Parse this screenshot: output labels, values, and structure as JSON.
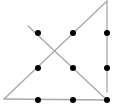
{
  "diagram": {
    "width": 116,
    "height": 105,
    "background": "#ffffff",
    "line_color": "#a8a8a8",
    "line_width": 1.3,
    "dot_color": "#000000",
    "dot_radius": 3,
    "dots": [
      {
        "x": 38,
        "y": 33
      },
      {
        "x": 73,
        "y": 33
      },
      {
        "x": 107,
        "y": 33
      },
      {
        "x": 38,
        "y": 68
      },
      {
        "x": 73,
        "y": 68
      },
      {
        "x": 107,
        "y": 68
      },
      {
        "x": 38,
        "y": 100
      },
      {
        "x": 73,
        "y": 100
      },
      {
        "x": 107,
        "y": 100
      }
    ],
    "lines": [
      {
        "x1": 28,
        "y1": 26,
        "x2": 107,
        "y2": 100
      },
      {
        "x1": 107,
        "y1": 100,
        "x2": 4,
        "y2": 99
      },
      {
        "x1": 4,
        "y1": 99,
        "x2": 107,
        "y2": 1
      },
      {
        "x1": 107,
        "y1": 1,
        "x2": 107,
        "y2": 92
      }
    ]
  }
}
